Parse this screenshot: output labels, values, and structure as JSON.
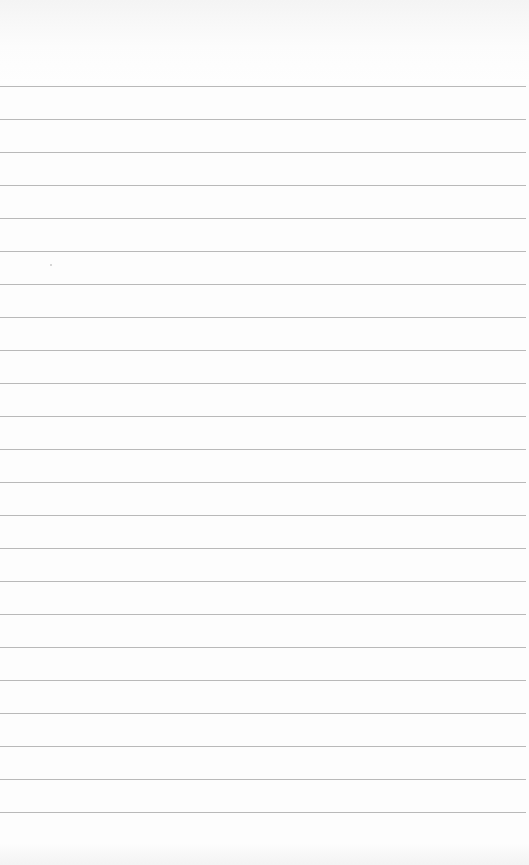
{
  "page": {
    "type": "ruled-notepad-sheet",
    "background_color": "#fdfdfd",
    "rule_color": "#b9b9b9",
    "rules": {
      "count": 24,
      "first_y": 86,
      "spacing": 33
    },
    "header_text": "",
    "footer_text": "",
    "body_text": []
  }
}
